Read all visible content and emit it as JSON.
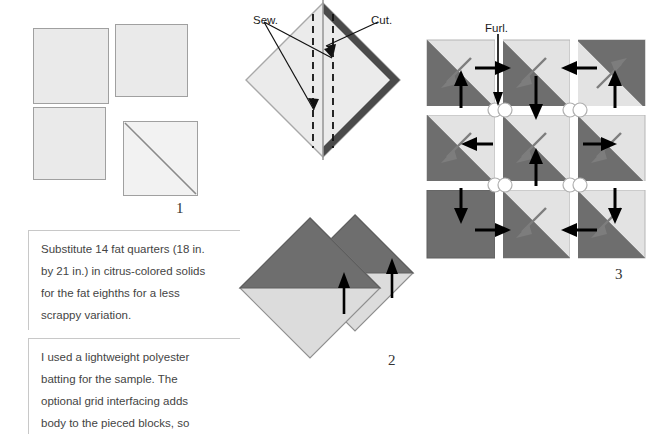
{
  "document": {
    "title": "Quilt block assembly instructions",
    "background_color": "#ffffff"
  },
  "palette": {
    "fabric_light": "#eaeaea",
    "fabric_light_alt": "#f2f2f2",
    "fabric_dark": "#6e6e6e",
    "fabric_dark_edge": "#4a4a4a",
    "outline": "#a0a0a0",
    "arrow_black": "#000000",
    "arrow_gray": "#7d7d7d",
    "text": "#444444",
    "rule": "#c8c8c8"
  },
  "steps": [
    {
      "id": "step-1",
      "number": "1",
      "caption": "Mark diagonal line on light squares"
    },
    {
      "id": "step-2",
      "number": "2",
      "caption": "Press half-square triangle units"
    },
    {
      "id": "step-3",
      "number": "3",
      "caption": "Furl seam intersections"
    }
  ],
  "step1": {
    "number": "1",
    "squares": [
      {
        "name": "square-top-left",
        "x": 33,
        "y": 28,
        "size": 76,
        "diagonal": false
      },
      {
        "name": "square-top-right",
        "x": 114,
        "y": 24,
        "size": 72,
        "diagonal": false
      },
      {
        "name": "square-bottom-left",
        "x": 33,
        "y": 107,
        "size": 73,
        "diagonal": false
      },
      {
        "name": "square-bottom-right",
        "x": 123,
        "y": 122,
        "size": 75,
        "diagonal": true
      }
    ]
  },
  "step2": {
    "number": "1",
    "labels": {
      "sew": "Sew.",
      "cut": "Cut."
    }
  },
  "step3": {
    "number": "2"
  },
  "step4": {
    "number": "3",
    "labels": {
      "furl": "Furl."
    },
    "grid": {
      "rows": 3,
      "cols": 3,
      "cells": [
        {
          "row": 0,
          "col": 0,
          "type": "hst",
          "orientation": "dark-lower-left",
          "gray_arrow": "down-left"
        },
        {
          "row": 0,
          "col": 1,
          "type": "hst",
          "orientation": "dark-lower-left",
          "gray_arrow": "down-left"
        },
        {
          "row": 0,
          "col": 2,
          "type": "hst",
          "orientation": "dark-upper-right",
          "gray_arrow": "up-right"
        },
        {
          "row": 1,
          "col": 0,
          "type": "hst",
          "orientation": "dark-lower-left",
          "gray_arrow": "down-left"
        },
        {
          "row": 1,
          "col": 1,
          "type": "hst",
          "orientation": "dark-lower-left",
          "gray_arrow": "down-left"
        },
        {
          "row": 1,
          "col": 2,
          "type": "hst",
          "orientation": "dark-lower-left",
          "gray_arrow": "down-left"
        },
        {
          "row": 2,
          "col": 0,
          "type": "solid-dark",
          "orientation": "none",
          "gray_arrow": "none"
        },
        {
          "row": 2,
          "col": 1,
          "type": "hst",
          "orientation": "dark-lower-left",
          "gray_arrow": "down-left"
        },
        {
          "row": 2,
          "col": 2,
          "type": "hst",
          "orientation": "dark-lower-left",
          "gray_arrow": "down-left"
        }
      ],
      "seam_arrows": [
        {
          "name": "seam-arrow-r0c0-up",
          "direction": "up"
        },
        {
          "name": "seam-arrow-r0c0-right",
          "direction": "right"
        },
        {
          "name": "seam-arrow-r0c1-down",
          "direction": "down"
        },
        {
          "name": "seam-arrow-r0c2-left",
          "direction": "left"
        },
        {
          "name": "seam-arrow-r0c2-up",
          "direction": "up"
        },
        {
          "name": "seam-arrow-r1c0-left",
          "direction": "left"
        },
        {
          "name": "seam-arrow-r1c1-up",
          "direction": "up"
        },
        {
          "name": "seam-arrow-r1c2-right",
          "direction": "right"
        },
        {
          "name": "seam-arrow-r2c0-down",
          "direction": "down"
        },
        {
          "name": "seam-arrow-r2c1-right",
          "direction": "right"
        },
        {
          "name": "seam-arrow-r2c2-left",
          "direction": "left"
        },
        {
          "name": "seam-arrow-r2c2-down",
          "direction": "down"
        }
      ],
      "junction_count": 4
    }
  },
  "notes": [
    {
      "name": "note-fat-quarters",
      "lines": [
        "Substitute 14 fat quarters (18 in.",
        "by 21 in.) in citrus-colored solids",
        "for the fat eighths for a less",
        "scrappy variation."
      ]
    },
    {
      "name": "note-batting",
      "lines": [
        "I used a lightweight polyester",
        "batting for the sample. The",
        "optional grid interfacing adds",
        "body to the pieced blocks, so"
      ]
    }
  ]
}
